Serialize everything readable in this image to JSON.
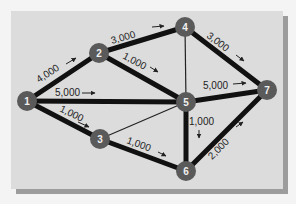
{
  "diagram": {
    "type": "network-flow",
    "nodes": [
      {
        "id": "1",
        "label": "1",
        "x": 27,
        "y": 101
      },
      {
        "id": "2",
        "label": "2",
        "x": 99,
        "y": 53
      },
      {
        "id": "3",
        "label": "3",
        "x": 100,
        "y": 139
      },
      {
        "id": "4",
        "label": "4",
        "x": 185,
        "y": 27
      },
      {
        "id": "5",
        "label": "5",
        "x": 186,
        "y": 102
      },
      {
        "id": "6",
        "label": "6",
        "x": 186,
        "y": 171
      },
      {
        "id": "7",
        "label": "7",
        "x": 267,
        "y": 90
      }
    ],
    "edges": [
      {
        "from": "1",
        "to": "2",
        "capacity": "4,000",
        "thick": true
      },
      {
        "from": "1",
        "to": "5",
        "capacity": "5,000",
        "thick": true
      },
      {
        "from": "1",
        "to": "3",
        "capacity": "1,000",
        "thick": true
      },
      {
        "from": "2",
        "to": "4",
        "capacity": "3,000",
        "thick": true
      },
      {
        "from": "2",
        "to": "5",
        "capacity": "1,000",
        "thick": true
      },
      {
        "from": "4",
        "to": "7",
        "capacity": "3,000",
        "thick": true
      },
      {
        "from": "5",
        "to": "7",
        "capacity": "5,000",
        "thick": true
      },
      {
        "from": "5",
        "to": "6",
        "capacity": "1,000",
        "thick": true
      },
      {
        "from": "3",
        "to": "6",
        "capacity": "1,000",
        "thick": true
      },
      {
        "from": "6",
        "to": "7",
        "capacity": "2,000",
        "thick": true
      },
      {
        "from": "4",
        "to": "5",
        "capacity": "",
        "thick": false
      },
      {
        "from": "3",
        "to": "5",
        "capacity": "",
        "thick": false
      }
    ],
    "labels": {
      "e12": "4,000",
      "e15": "5,000",
      "e13": "1,000",
      "e24": "3,000",
      "e25": "1,000",
      "e47": "3,000",
      "e57": "5,000",
      "e56": "1,000",
      "e36": "1,000",
      "e67": "2,000"
    },
    "colors": {
      "panel": "#dcdcdc",
      "shadow": "#9c9c9c",
      "edge": "#111111",
      "node": "#5a5a5a",
      "node_text": "#f0f0f0"
    }
  }
}
